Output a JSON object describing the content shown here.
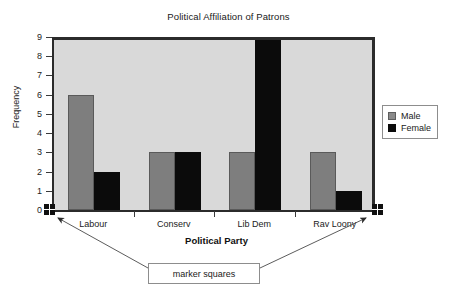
{
  "chart_data": {
    "type": "bar",
    "title": "Political Affiliation of Patrons",
    "xlabel": "Political Party",
    "ylabel": "Frequency",
    "categories": [
      "Labour",
      "Conserv",
      "Lib Dem",
      "Rav Loony"
    ],
    "series": [
      {
        "name": "Male",
        "color": "#7e7e7e",
        "values": [
          6,
          3,
          3,
          3
        ]
      },
      {
        "name": "Female",
        "color": "#0b0b0b",
        "values": [
          2,
          3,
          9,
          1
        ]
      }
    ],
    "ylim": [
      0,
      9
    ],
    "yticks": [
      0,
      1,
      2,
      3,
      4,
      5,
      6,
      7,
      8,
      9
    ],
    "ytick_labels": [
      "0",
      "1",
      "2",
      "3",
      "4",
      "5",
      "6",
      "7",
      "8",
      "9"
    ],
    "grid": false,
    "legend_position": "right",
    "plot_background": "#d9d9d9",
    "annotations": [
      {
        "text": "marker squares",
        "targets": [
          "origin-marker-square",
          "right-marker-square"
        ]
      }
    ]
  },
  "legend": {
    "entries": [
      {
        "label": "Male",
        "swatch": "male-swatch"
      },
      {
        "label": "Female",
        "swatch": "female-swatch"
      }
    ]
  },
  "markers": {
    "origin_label": "marker square at origin",
    "right_label": "marker square at right end of axis"
  }
}
